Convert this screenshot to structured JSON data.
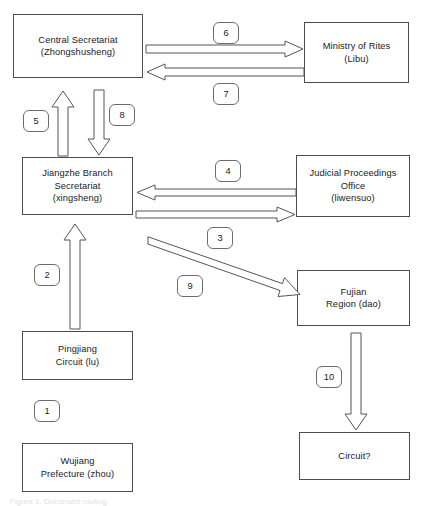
{
  "diagram": {
    "width": 426,
    "height": 506,
    "background": "#ffffff",
    "line_color": "#4c4c4c",
    "arrow_stroke": "#555555",
    "text_color": "#1a1a1a"
  },
  "nodes": [
    {
      "id": "central-secretariat",
      "label": "Central Secretariat\n(Zhongshusheng)",
      "x": 13,
      "y": 14,
      "w": 130,
      "h": 64
    },
    {
      "id": "ministry-of-rites",
      "label": "Ministry of Rites\n(Libu)",
      "x": 304,
      "y": 22,
      "w": 105,
      "h": 61
    },
    {
      "id": "jiangzhe-branch",
      "label": "Jiangzhe Branch\nSecretariat\n(xingsheng)",
      "x": 22,
      "y": 157,
      "w": 111,
      "h": 58
    },
    {
      "id": "judicial-office",
      "label": "Judicial Proceedings\nOffice\n(liwensuo)",
      "x": 296,
      "y": 155,
      "w": 114,
      "h": 62
    },
    {
      "id": "fujian-region",
      "label": "Fujian\nRegion (dao)",
      "x": 297,
      "y": 270,
      "w": 113,
      "h": 56
    },
    {
      "id": "pingjiang-circuit",
      "label": "Pingjiang\nCircuit (lu)",
      "x": 22,
      "y": 331,
      "w": 111,
      "h": 49
    },
    {
      "id": "wujiang-prefecture",
      "label": "Wujiang\nPrefecture (zhou)",
      "x": 22,
      "y": 443,
      "w": 111,
      "h": 49
    },
    {
      "id": "circuit-unknown",
      "label": "Circuit?",
      "x": 299,
      "y": 432,
      "w": 111,
      "h": 48
    }
  ],
  "badges": [
    {
      "id": "badge-1",
      "number": "1",
      "x": 34,
      "y": 400
    },
    {
      "id": "badge-2",
      "number": "2",
      "x": 34,
      "y": 264
    },
    {
      "id": "badge-3",
      "number": "3",
      "x": 207,
      "y": 227
    },
    {
      "id": "badge-4",
      "number": "4",
      "x": 215,
      "y": 160
    },
    {
      "id": "badge-5",
      "number": "5",
      "x": 23,
      "y": 110
    },
    {
      "id": "badge-6",
      "number": "6",
      "x": 213,
      "y": 22
    },
    {
      "id": "badge-7",
      "number": "7",
      "x": 213,
      "y": 83
    },
    {
      "id": "badge-8",
      "number": "8",
      "x": 109,
      "y": 104
    },
    {
      "id": "badge-9",
      "number": "9",
      "x": 177,
      "y": 275
    },
    {
      "id": "badge-10",
      "number": "10",
      "x": 316,
      "y": 366
    }
  ],
  "edges": [
    {
      "id": "edge-1",
      "number": "1",
      "from": "wujiang-prefecture",
      "to": "pingjiang-circuit",
      "direction": "up"
    },
    {
      "id": "edge-2",
      "number": "2",
      "from": "pingjiang-circuit",
      "to": "jiangzhe-branch",
      "direction": "up"
    },
    {
      "id": "edge-3",
      "number": "3",
      "from": "jiangzhe-branch",
      "to": "judicial-office",
      "direction": "right"
    },
    {
      "id": "edge-4",
      "number": "4",
      "from": "judicial-office",
      "to": "jiangzhe-branch",
      "direction": "left"
    },
    {
      "id": "edge-5",
      "number": "5",
      "from": "jiangzhe-branch",
      "to": "central-secretariat",
      "direction": "up"
    },
    {
      "id": "edge-6",
      "number": "6",
      "from": "central-secretariat",
      "to": "ministry-of-rites",
      "direction": "right"
    },
    {
      "id": "edge-7",
      "number": "7",
      "from": "ministry-of-rites",
      "to": "central-secretariat",
      "direction": "left"
    },
    {
      "id": "edge-8",
      "number": "8",
      "from": "central-secretariat",
      "to": "jiangzhe-branch",
      "direction": "down"
    },
    {
      "id": "edge-9",
      "number": "9",
      "from": "jiangzhe-branch",
      "to": "fujian-region",
      "direction": "diagonal-down-right"
    },
    {
      "id": "edge-10",
      "number": "10",
      "from": "fujian-region",
      "to": "circuit-unknown",
      "direction": "down"
    }
  ],
  "caption": {
    "text": "Figure 1. Document routing",
    "x": 10,
    "y": 497
  }
}
